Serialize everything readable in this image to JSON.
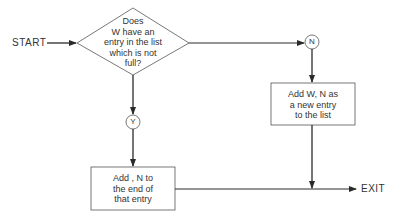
{
  "diagram": {
    "type": "flowchart",
    "start_label": "START",
    "exit_label": "EXIT",
    "decision": {
      "lines": [
        "Does",
        "W have an",
        "entry in the list",
        "which is not",
        "full?"
      ]
    },
    "yes_label": "Y",
    "no_label": "N",
    "yes_action": {
      "lines": [
        "Add , N to",
        "the end of",
        "that entry"
      ]
    },
    "no_action": {
      "lines": [
        "Add W, N as",
        "a new entry",
        "to the list"
      ]
    },
    "colors": {
      "stroke": "#2a2a2a",
      "text": "#333333",
      "background": "#ffffff"
    }
  }
}
